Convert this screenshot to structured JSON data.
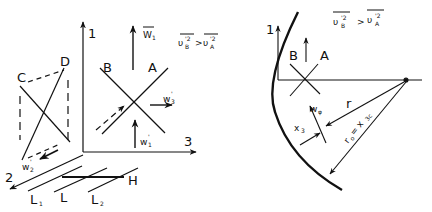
{
  "left_panel": {
    "axes": {
      "axis_1": "1",
      "axis_2": "2",
      "axis_3": "3"
    },
    "points": {
      "C": "C",
      "D": "D",
      "B": "B",
      "A": "A",
      "H": "H"
    },
    "vectors": {
      "W1": "W",
      "W1_sub": "1",
      "w3": "w",
      "w3_sub": "3",
      "w3_sup": "'",
      "w1": "w",
      "w1_sub": "1",
      "w1_sup": "'",
      "w2": "w",
      "w2_sub": "2",
      "w2_sup": "'"
    },
    "lengths": {
      "L1": "L",
      "L1_sub": "1",
      "L": "L",
      "L2": "L",
      "L2_sub": "2"
    },
    "inequality": {
      "lhs": "υ",
      "lhs_sub": "B",
      "lhs_sup": "'2",
      "op": ">",
      "rhs": "υ",
      "rhs_sub": "A",
      "rhs_sup": "'2"
    }
  },
  "right_panel": {
    "axes": {
      "axis_1": "1"
    },
    "points": {
      "B": "B",
      "A": "A"
    },
    "inequality": {
      "lhs": "υ",
      "lhs_sub": "B",
      "lhs_sup": "'2",
      "op": ">",
      "rhs": "υ",
      "rhs_sub": "A",
      "rhs_sup": "'2"
    },
    "labels": {
      "r": "r",
      "w_phi": "w",
      "w_phi_sub": "φ",
      "x3": "x",
      "x3_sub": "3",
      "r0": "r",
      "r0_sub": "o",
      "eq": "= x",
      "eq_sub": "3c"
    }
  }
}
